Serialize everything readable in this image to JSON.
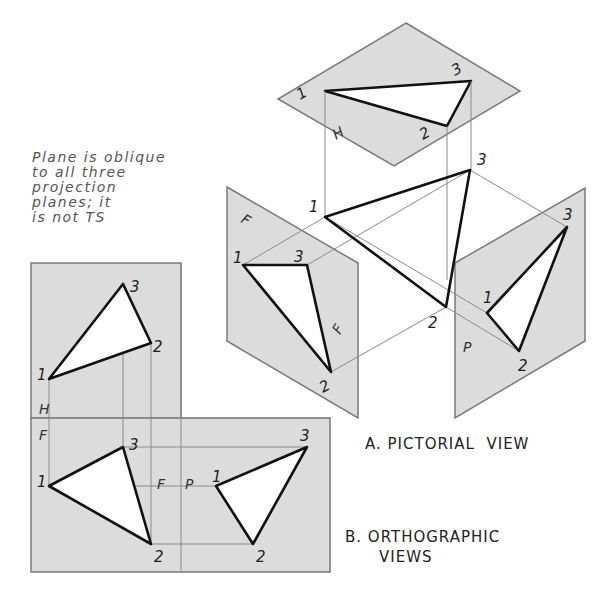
{
  "note": {
    "lines": [
      "Plane is oblique",
      "to all three",
      "projection",
      "planes; it",
      "is not TS"
    ]
  },
  "captions": {
    "pictorial": "A. PICTORIAL  VIEW",
    "ortho_line1": "B. ORTHOGRAPHIC",
    "ortho_line2": "VIEWS"
  },
  "pictorial": {
    "planes": {
      "horizontal": {
        "label": "H",
        "polygon": [
          [
            406,
            23
          ],
          [
            520,
            91
          ],
          [
            394,
            166
          ],
          [
            278,
            99
          ]
        ]
      },
      "frontal": {
        "label": "F",
        "label2": "F",
        "polygon": [
          [
            227,
            187
          ],
          [
            358,
            263
          ],
          [
            358,
            418
          ],
          [
            227,
            341
          ]
        ]
      },
      "profile": {
        "label": "P",
        "polygon": [
          [
            455,
            263
          ],
          [
            585,
            188
          ],
          [
            585,
            341
          ],
          [
            455,
            418
          ]
        ]
      }
    },
    "triangle_space": {
      "points": {
        "1": [
          325,
          217
        ],
        "2": [
          446,
          307
        ],
        "3": [
          470,
          170
        ]
      }
    },
    "triangle_h": {
      "points": {
        "1": [
          325,
          91
        ],
        "2": [
          447,
          126
        ],
        "3": [
          471,
          81
        ]
      }
    },
    "triangle_f": {
      "points": {
        "1": [
          243,
          265
        ],
        "2": [
          331,
          372
        ],
        "3": [
          307,
          265
        ]
      }
    },
    "triangle_p": {
      "points": {
        "1": [
          487,
          313
        ],
        "2": [
          519,
          351
        ],
        "3": [
          567,
          227
        ]
      }
    }
  },
  "orthographic": {
    "labels": {
      "h": "H",
      "f": "F",
      "f2": "F",
      "p": "P"
    },
    "triangle_top": {
      "points": {
        "1": [
          49,
          379
        ],
        "2": [
          151,
          343
        ],
        "3": [
          123,
          284
        ]
      }
    },
    "triangle_front": {
      "points": {
        "1": [
          49,
          486
        ],
        "2": [
          151,
          544
        ],
        "3": [
          123,
          447
        ]
      }
    },
    "triangle_side": {
      "points": {
        "1": [
          216,
          486
        ],
        "2": [
          253,
          544
        ],
        "3": [
          307,
          447
        ]
      }
    }
  },
  "vertex_labels": [
    "1",
    "2",
    "3"
  ],
  "colors": {
    "plane_fill": "#dcdcdc",
    "plane_edge": "#7a7a7a",
    "edge": "#111111",
    "projector": "#8a8a8a"
  }
}
